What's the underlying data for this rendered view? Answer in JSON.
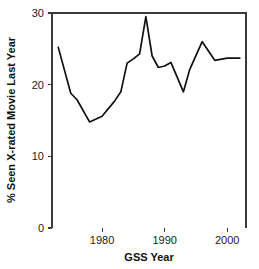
{
  "chart_data": {
    "type": "line",
    "title": "",
    "xlabel": "GSS Year",
    "ylabel": "% Seen X-rated Movie Last Year",
    "xlim": [
      1972.0,
      2003.0
    ],
    "ylim": [
      0,
      30
    ],
    "xticks": [
      1980,
      1990,
      2000
    ],
    "xtick_labels": [
      "1980",
      "1990",
      "2000"
    ],
    "yticks": [
      0,
      10,
      20,
      30
    ],
    "ytick_labels": [
      "0",
      "10",
      "20",
      "30"
    ],
    "grid": false,
    "legend": false,
    "line_color": "#111111",
    "axis_color": "#3a3a3a",
    "background": "#ffffff",
    "x": [
      1973,
      1975,
      1976,
      1978,
      1980,
      1982,
      1983,
      1984,
      1985,
      1986,
      1987,
      1988,
      1989,
      1990,
      1991,
      1993,
      1994,
      1996,
      1998,
      2000,
      2002
    ],
    "y": [
      25.2,
      18.8,
      17.9,
      14.8,
      15.6,
      17.7,
      19.0,
      23.0,
      23.6,
      24.3,
      29.5,
      24.0,
      22.4,
      22.6,
      23.1,
      19.0,
      22.1,
      26.0,
      23.4,
      23.7,
      23.7
    ],
    "series": [
      {
        "name": "% Seen X-rated Movie Last Year",
        "values": [
          25.2,
          18.8,
          17.9,
          14.8,
          15.6,
          17.7,
          19.0,
          23.0,
          23.6,
          24.3,
          29.5,
          24.0,
          22.4,
          22.6,
          23.1,
          19.0,
          22.1,
          26.0,
          23.4,
          23.7,
          23.7
        ]
      }
    ]
  },
  "plot": {
    "left": 52,
    "right": 246,
    "top": 13,
    "bottom": 228,
    "xaxis_title_y": 261,
    "yaxis_title_x": 15
  }
}
